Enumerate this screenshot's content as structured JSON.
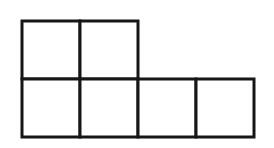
{
  "canvas": {
    "width": 274,
    "height": 148,
    "background": "#ffffff"
  },
  "figure": {
    "label": "six-unit-square-shape",
    "stroke_color": "#161616",
    "fill_color": "#ffffff",
    "stroke_width": 3,
    "cell_size": 58,
    "origin": {
      "x": 22,
      "y": 21
    },
    "rows": 2,
    "cols": 4,
    "cells": [
      {
        "row": 0,
        "col": 0
      },
      {
        "row": 0,
        "col": 1
      },
      {
        "row": 1,
        "col": 0
      },
      {
        "row": 1,
        "col": 1
      },
      {
        "row": 1,
        "col": 2
      },
      {
        "row": 1,
        "col": 3
      }
    ]
  }
}
